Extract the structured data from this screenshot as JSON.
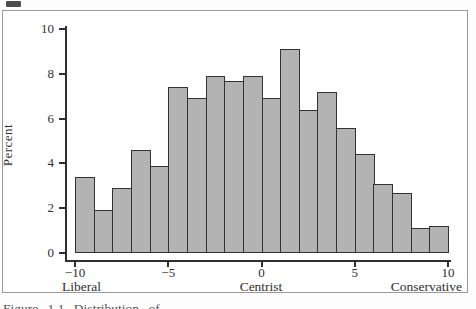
{
  "figure": {
    "ylabel": "Percent",
    "annotations": {
      "left": "Liberal",
      "center": "Centrist",
      "right": "Conservative"
    },
    "caption_fragment": "Figure 1.1   Distribution of …"
  },
  "chart_data": {
    "type": "bar",
    "subtype": "histogram",
    "title": "",
    "xlabel": "",
    "ylabel": "Percent",
    "xlim": [
      -10,
      10
    ],
    "ylim": [
      0,
      10
    ],
    "grid": false,
    "legend": "none",
    "bin_width": 1,
    "bin_edges": [
      -10,
      -9,
      -8,
      -7,
      -6,
      -5,
      -4,
      -3,
      -2,
      -1,
      0,
      1,
      2,
      3,
      4,
      5,
      6,
      7,
      8,
      9,
      10
    ],
    "values": [
      3.4,
      1.9,
      2.9,
      4.6,
      3.9,
      7.4,
      6.9,
      7.9,
      7.7,
      7.9,
      6.9,
      9.1,
      6.4,
      7.2,
      5.6,
      4.4,
      3.1,
      2.7,
      1.1,
      1.2
    ],
    "x_tick_values": [
      -10,
      -5,
      0,
      5,
      10
    ],
    "x_tick_labels": [
      "−10",
      "−5",
      "0",
      "5",
      "10"
    ],
    "y_tick_values": [
      0,
      2,
      4,
      6,
      8,
      10
    ],
    "y_tick_labels": [
      "0",
      "2",
      "4",
      "6",
      "8",
      "10"
    ],
    "x_axis_annotations": [
      "Liberal",
      "Centrist",
      "Conservative"
    ],
    "colors": {
      "bar_fill": "#b3b3b3",
      "bar_border": "#333333",
      "axis": "#2f2f2f",
      "figure_border": "#9a9a9a",
      "background": "#ffffff"
    }
  }
}
